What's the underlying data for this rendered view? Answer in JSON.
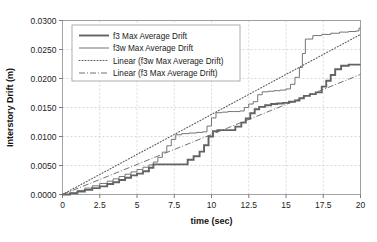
{
  "chart_data": {
    "type": "line",
    "title": "",
    "xlabel": "time (sec)",
    "ylabel": "Interstory Drift (m)",
    "xlim": [
      0,
      20
    ],
    "ylim": [
      0,
      0.03
    ],
    "grid": true,
    "legend_position": "top-left-inside",
    "xticks": [
      "0",
      "2.5",
      "5",
      "7.5",
      "10",
      "12.5",
      "15",
      "17.5",
      "20"
    ],
    "xtick_values": [
      0,
      2.5,
      5,
      7.5,
      10,
      12.5,
      15,
      17.5,
      20
    ],
    "yticks": [
      "0.0000",
      "0.0050",
      "0.0100",
      "0.0150",
      "0.0200",
      "0.0250",
      "0.0300"
    ],
    "ytick_values": [
      0,
      0.005,
      0.01,
      0.015,
      0.02,
      0.025,
      0.03
    ],
    "series": [
      {
        "name": "f3 Max Average Drift",
        "style": "solid-thick",
        "color": "#636363",
        "x": [
          0,
          0.5,
          1.0,
          1.5,
          2.0,
          2.5,
          3.0,
          3.4,
          3.8,
          4.2,
          4.6,
          5.0,
          5.4,
          5.8,
          6.1,
          6.4,
          6.8,
          7.2,
          7.6,
          8.0,
          8.4,
          8.8,
          9.2,
          9.5,
          9.8,
          10.1,
          10.4,
          10.8,
          11.2,
          11.6,
          12.0,
          12.3,
          12.6,
          12.9,
          13.2,
          13.6,
          14.0,
          14.4,
          14.8,
          15.2,
          15.6,
          15.9,
          16.2,
          16.6,
          17.0,
          17.4,
          17.7,
          18.0,
          18.3,
          18.7,
          19.2,
          19.7,
          20.0
        ],
        "y": [
          0.0,
          0.0002,
          0.0005,
          0.0008,
          0.0011,
          0.0014,
          0.0018,
          0.0021,
          0.0025,
          0.0029,
          0.0033,
          0.0036,
          0.004,
          0.0046,
          0.0052,
          0.0052,
          0.0052,
          0.0052,
          0.0052,
          0.0052,
          0.006,
          0.0066,
          0.0074,
          0.0085,
          0.01,
          0.0109,
          0.0111,
          0.0111,
          0.0111,
          0.0117,
          0.0124,
          0.0131,
          0.014,
          0.0147,
          0.0151,
          0.0154,
          0.0156,
          0.0157,
          0.0158,
          0.016,
          0.0162,
          0.0166,
          0.017,
          0.0173,
          0.0176,
          0.0186,
          0.0196,
          0.0206,
          0.0216,
          0.0222,
          0.0224,
          0.0224,
          0.0224
        ]
      },
      {
        "name": "f3w Max Average Drift",
        "style": "solid-thin",
        "color": "#6f6f6f",
        "x": [
          0,
          0.5,
          1.0,
          1.5,
          2.0,
          2.5,
          3.0,
          3.4,
          3.8,
          4.2,
          4.6,
          5.0,
          5.4,
          5.8,
          6.1,
          6.4,
          6.7,
          7.0,
          7.3,
          7.6,
          8.0,
          8.5,
          9.0,
          9.4,
          9.7,
          10.0,
          10.3,
          10.7,
          11.1,
          11.5,
          11.9,
          12.2,
          12.5,
          12.8,
          13.1,
          13.4,
          13.8,
          14.2,
          14.6,
          15.0,
          15.3,
          15.6,
          15.9,
          16.1,
          16.3,
          16.8,
          17.4,
          18.0,
          18.6,
          19.2,
          19.7,
          19.9,
          20.0
        ],
        "y": [
          0.0,
          0.0003,
          0.0007,
          0.0011,
          0.0015,
          0.0019,
          0.0023,
          0.0027,
          0.0031,
          0.0035,
          0.0039,
          0.0043,
          0.0047,
          0.0051,
          0.0056,
          0.0064,
          0.0073,
          0.0084,
          0.0095,
          0.0103,
          0.0105,
          0.0106,
          0.0107,
          0.0108,
          0.0118,
          0.0132,
          0.0141,
          0.0142,
          0.0143,
          0.0143,
          0.0144,
          0.015,
          0.0156,
          0.016,
          0.0172,
          0.0177,
          0.0178,
          0.0179,
          0.018,
          0.0182,
          0.019,
          0.0202,
          0.0219,
          0.0243,
          0.0268,
          0.0274,
          0.0276,
          0.0278,
          0.028,
          0.0281,
          0.0282,
          0.0287,
          0.0287
        ]
      },
      {
        "name": "Linear (f3w Max Average Drift)",
        "style": "dotted",
        "color": "#5e5e5e",
        "x": [
          0,
          20
        ],
        "y": [
          0.0,
          0.0276
        ]
      },
      {
        "name": "Linear (f3 Max Average Drift)",
        "style": "dash-dot",
        "color": "#6a6a6a",
        "x": [
          0,
          20
        ],
        "y": [
          0.0,
          0.0207
        ]
      }
    ],
    "legend": [
      {
        "label": "f3 Max Average Drift",
        "style": "solid-thick"
      },
      {
        "label": "f3w Max Average Drift",
        "style": "solid-thin"
      },
      {
        "label": "Linear (f3w Max Average Drift)",
        "style": "dotted"
      },
      {
        "label": "Linear (f3 Max Average Drift)",
        "style": "dash-dot"
      }
    ]
  }
}
